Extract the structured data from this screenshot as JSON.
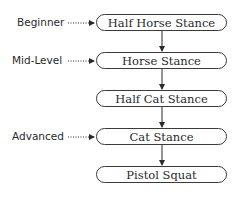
{
  "diagram": {
    "type": "flowchart",
    "steps": [
      {
        "label": "Half Horse Stance"
      },
      {
        "label": "Horse Stance"
      },
      {
        "label": "Half Cat Stance"
      },
      {
        "label": "Cat Stance"
      },
      {
        "label": "Pistol Squat"
      }
    ],
    "levels": [
      {
        "label": "Beginner",
        "points_to": 0
      },
      {
        "label": "Mid-Level",
        "points_to": 1
      },
      {
        "label": "Advanced",
        "points_to": 3
      }
    ],
    "colors": {
      "stroke": "#3a3a3a",
      "text": "#2a2a2a",
      "background": "#ffffff"
    }
  }
}
